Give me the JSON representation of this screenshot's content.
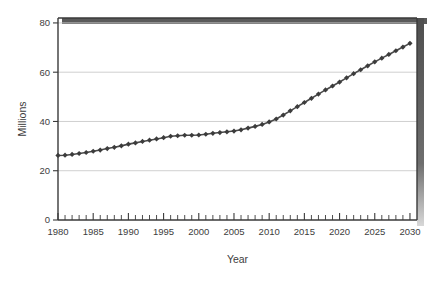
{
  "chart": {
    "background_color": "#ffffff",
    "line_color": "#4a4a4a",
    "marker_color": "#3c3c3c",
    "grid_color": "#c9c9c9",
    "axis_color": "#3a3a3a",
    "shadow_color": "#5a5a5a"
  },
  "chart_data": {
    "type": "line",
    "title": "",
    "xlabel": "Year",
    "ylabel": "Millions",
    "xlim": [
      1980,
      2031
    ],
    "ylim": [
      0,
      82
    ],
    "xticks": [
      1980,
      1985,
      1990,
      1995,
      2000,
      2005,
      2010,
      2015,
      2020,
      2025,
      2030
    ],
    "xtick_labels": [
      "1980",
      "1985",
      "1990",
      "1995",
      "2000",
      "2005",
      "2010",
      "2015",
      "2020",
      "2025",
      "2030"
    ],
    "yticks": [
      0,
      20,
      40,
      60,
      80
    ],
    "ytick_labels": [
      "0",
      "20",
      "40",
      "60",
      "80"
    ],
    "grid": "horizontal",
    "legend": "none",
    "marker": "diamond",
    "x": [
      1980,
      1981,
      1982,
      1983,
      1984,
      1985,
      1986,
      1987,
      1988,
      1989,
      1990,
      1991,
      1992,
      1993,
      1994,
      1995,
      1996,
      1997,
      1998,
      1999,
      2000,
      2001,
      2002,
      2003,
      2004,
      2005,
      2006,
      2007,
      2008,
      2009,
      2010,
      2011,
      2012,
      2013,
      2014,
      2015,
      2016,
      2017,
      2018,
      2019,
      2020,
      2021,
      2022,
      2023,
      2024,
      2025,
      2026,
      2027,
      2028,
      2029,
      2030
    ],
    "values": [
      26.2,
      26.3,
      26.6,
      27.0,
      27.4,
      27.9,
      28.4,
      29.0,
      29.5,
      30.1,
      30.8,
      31.3,
      31.9,
      32.4,
      32.9,
      33.4,
      34.0,
      34.2,
      34.4,
      34.4,
      34.5,
      34.8,
      35.2,
      35.5,
      35.8,
      36.1,
      36.6,
      37.3,
      38.0,
      38.8,
      39.8,
      41.0,
      42.6,
      44.3,
      46.0,
      47.7,
      49.4,
      51.1,
      52.8,
      54.4,
      56.0,
      57.7,
      59.4,
      61.0,
      62.6,
      64.2,
      65.7,
      67.2,
      68.7,
      70.2,
      71.7
    ]
  }
}
